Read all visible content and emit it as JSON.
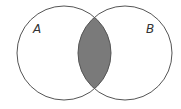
{
  "diagram": {
    "type": "venn",
    "sets": [
      {
        "label": "A",
        "cx": 64,
        "cy": 53,
        "r": 47
      },
      {
        "label": "B",
        "cx": 125,
        "cy": 53,
        "r": 47
      }
    ],
    "shaded_region": "A ∩ B",
    "colors": {
      "stroke": "#555555",
      "fill": "#7a7a7a",
      "background": "#ffffff"
    }
  }
}
